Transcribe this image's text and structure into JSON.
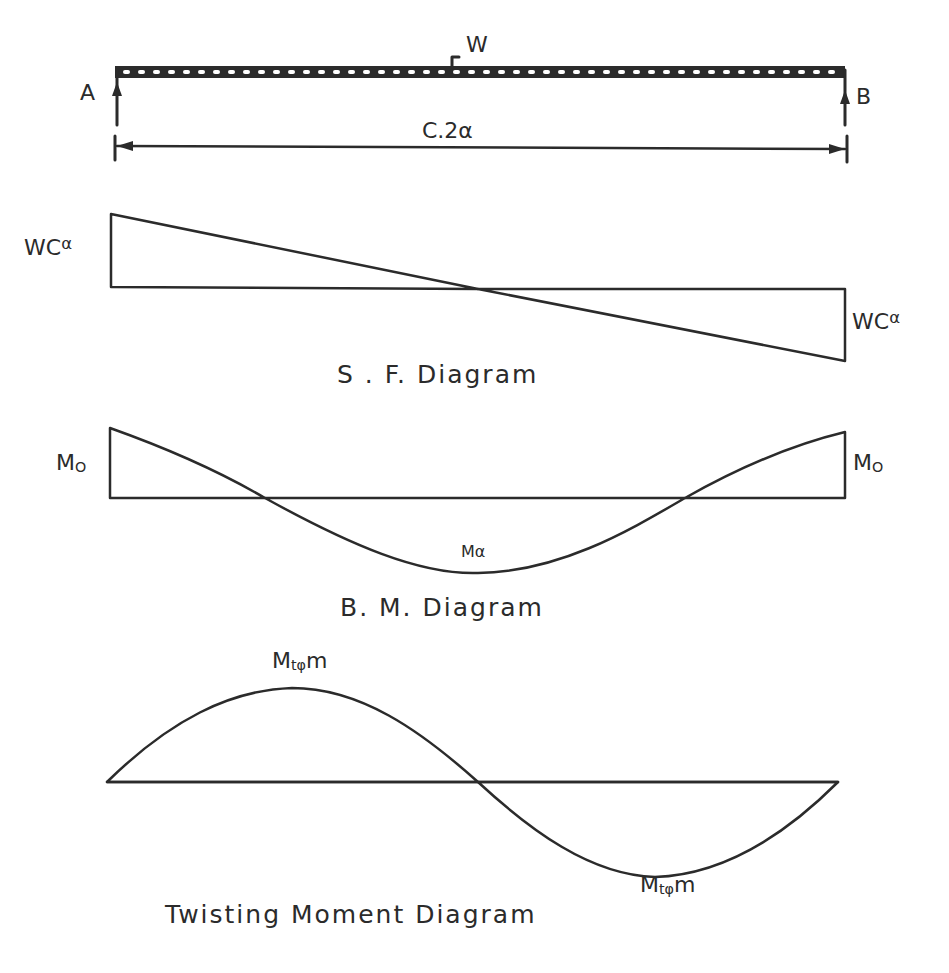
{
  "beam": {
    "support_left": "A",
    "support_right": "B",
    "load_label": "W",
    "span_label": "C.2α",
    "x_left": 115,
    "x_right": 845
  },
  "sf_diagram": {
    "title": "S . F. Diagram",
    "left_label_main": "WC",
    "left_label_sup": "α",
    "right_label_main": "WC",
    "right_label_sup": "α"
  },
  "bm_diagram": {
    "title": "B. M. Diagram",
    "left_label_main": "M",
    "left_label_sub": "O",
    "right_label_main": "M",
    "right_label_sub": "O",
    "mid_label": "Mα"
  },
  "tm_diagram": {
    "title": "Twisting Moment Diagram",
    "peak_label_main": "M",
    "peak_label_sub": "tφ",
    "peak_label_tail": "m",
    "trough_label_main": "M",
    "trough_label_sub": "tφ",
    "trough_label_tail": "m"
  },
  "colors": {
    "ink": "#2b2b2b",
    "background": "#ffffff"
  }
}
